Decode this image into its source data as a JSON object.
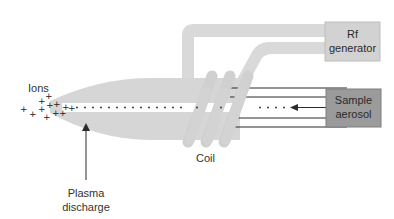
{
  "diagram": {
    "colors": {
      "pipe": "#d9d9d9",
      "plasma": "#d6d6d6",
      "coil": "#d0d0d0",
      "rf_box_fill": "#d2d2d2",
      "rf_box_stroke": "#bdbdbd",
      "sample_box_fill": "#9b9b9b",
      "sample_box_stroke": "#7f7f7f",
      "line": "#2b2b2b",
      "text": "#333333"
    },
    "labels": {
      "ions": "Ions",
      "plasma_line1": "Plasma",
      "plasma_line2": "discharge",
      "coil": "Coil",
      "rf_line1": "Rf",
      "rf_line2": "generator",
      "sample_line1": "Sample",
      "sample_line2": "aerosol"
    },
    "ion_symbol": "+",
    "icons": {
      "flow_arrow": "arrow-left-icon",
      "pointer_arrow": "arrow-up-icon"
    }
  }
}
